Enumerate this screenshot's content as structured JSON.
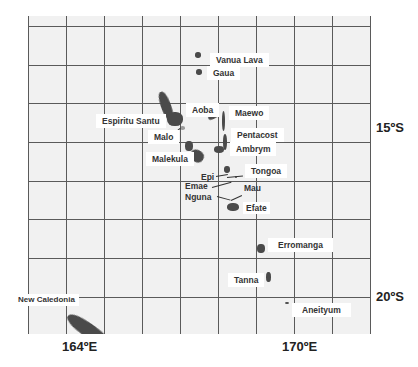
{
  "map": {
    "title": "Vanuatu archipelago",
    "grid": {
      "vertical_x": [
        0,
        38,
        76,
        114,
        152,
        190,
        228,
        266,
        304,
        342
      ],
      "horizontal_y": [
        10,
        49,
        87,
        126,
        165,
        203,
        242,
        281
      ]
    },
    "colors": {
      "ocean": "#f1f1f1",
      "grid": "#5a5a5a",
      "land": "#4a4a4a",
      "label_bg": "#ffffff"
    },
    "axis_labels": {
      "lat_15": "15ºS",
      "lat_20": "20ºS",
      "lon_164": "164ºE",
      "lon_170": "170ºE"
    },
    "labels": [
      {
        "name": "Vanua Lava",
        "x": 210,
        "y": 53
      },
      {
        "name": "Gaua",
        "x": 207,
        "y": 66
      },
      {
        "name": "Aoba",
        "x": 186,
        "y": 103
      },
      {
        "name": "Maewo",
        "x": 229,
        "y": 106
      },
      {
        "name": "Espiritu Santu",
        "x": 96,
        "y": 114
      },
      {
        "name": "Pentacost",
        "x": 231,
        "y": 128
      },
      {
        "name": "Malo",
        "x": 148,
        "y": 130
      },
      {
        "name": "Ambrym",
        "x": 230,
        "y": 142
      },
      {
        "name": "Malekula",
        "x": 146,
        "y": 152
      },
      {
        "name": "Tongoa",
        "x": 245,
        "y": 164
      },
      {
        "name": "Epi",
        "x": 200,
        "y": 172
      },
      {
        "name": "Emae",
        "x": 184,
        "y": 181
      },
      {
        "name": "Mau",
        "x": 243,
        "y": 183
      },
      {
        "name": "Nguna",
        "x": 184,
        "y": 192
      },
      {
        "name": "Efate",
        "x": 243,
        "y": 202
      },
      {
        "name": "Erromanga",
        "x": 268,
        "y": 238
      },
      {
        "name": "Tanna",
        "x": 228,
        "y": 273
      },
      {
        "name": "New Caledonia",
        "x": 14,
        "y": 294
      },
      {
        "name": "Aneityum",
        "x": 292,
        "y": 303
      }
    ]
  }
}
